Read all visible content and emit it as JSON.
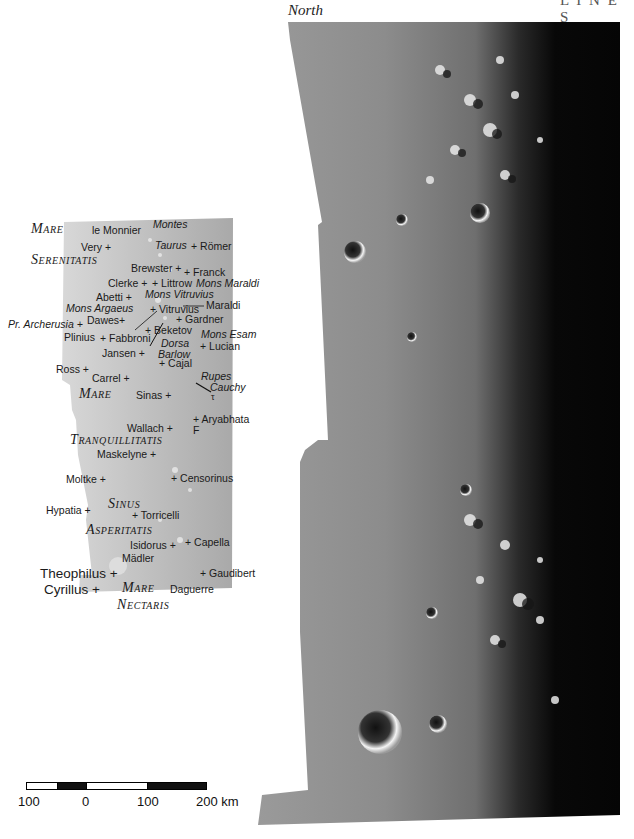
{
  "header": {
    "north_label": "North",
    "cutoff_text": "L I N E S"
  },
  "colors": {
    "background": "#ffffff",
    "keymap_fill": "#b3b3b3",
    "photo_dark": "#050505",
    "photo_mid": "#8a8a8a",
    "photo_light": "#c9c9c9"
  },
  "keymap": {
    "seas": [
      {
        "id": "mare-serenitatis-1",
        "cap": "M",
        "rest": "ARE"
      },
      {
        "id": "mare-serenitatis-2",
        "cap": "S",
        "rest": "ERENITATIS"
      },
      {
        "id": "mare-tranq-1",
        "cap": "M",
        "rest": "ARE"
      },
      {
        "id": "mare-tranq-2",
        "cap": "T",
        "rest": "RANQUILLITATIS"
      },
      {
        "id": "sinus-1",
        "cap": "S",
        "rest": "INUS"
      },
      {
        "id": "sinus-2",
        "cap": "A",
        "rest": "SPERITATIS"
      },
      {
        "id": "mare-nectaris-1",
        "cap": "M",
        "rest": "ARE"
      },
      {
        "id": "mare-nectaris-2",
        "cap": "N",
        "rest": "ECTARIS"
      }
    ],
    "features": [
      {
        "name": "le Monnier"
      },
      {
        "name": "Montes"
      },
      {
        "name": "Very +"
      },
      {
        "name": "Taurus"
      },
      {
        "name": "+ Römer"
      },
      {
        "name": "Brewster +"
      },
      {
        "name": "+ Franck"
      },
      {
        "name": "Clerke +"
      },
      {
        "name": "+ Littrow"
      },
      {
        "name": "Mons Maraldi"
      },
      {
        "name": "Abetti +"
      },
      {
        "name": "Mons Vitruvius"
      },
      {
        "name": "Mons Argaeus"
      },
      {
        "name": "+ Vitruvius"
      },
      {
        "name": "Maraldi"
      },
      {
        "name": "Pr. Archerusia +"
      },
      {
        "name": "Dawes+"
      },
      {
        "name": "+ Gardner"
      },
      {
        "name": "+ Beketov"
      },
      {
        "name": "Plinius"
      },
      {
        "name": "+ Fabbroni"
      },
      {
        "name": "Mons Esam"
      },
      {
        "name": "Dorsa"
      },
      {
        "name": "Barlow"
      },
      {
        "name": "+ Lucian"
      },
      {
        "name": "Jansen +"
      },
      {
        "name": "+ Cajal"
      },
      {
        "name": "Ross +"
      },
      {
        "name": "Carrel +"
      },
      {
        "name": "Rupes"
      },
      {
        "name": "Cauchy"
      },
      {
        "name": "τ"
      },
      {
        "name": "Sinas +"
      },
      {
        "name": "+ Aryabhata"
      },
      {
        "name": "Wallach +"
      },
      {
        "name": "F"
      },
      {
        "name": "Maskelyne +"
      },
      {
        "name": "Moltke +"
      },
      {
        "name": "+ Censorinus"
      },
      {
        "name": "Hypatia +"
      },
      {
        "name": "+ Torricelli"
      },
      {
        "name": "Isidorus +"
      },
      {
        "name": "+ Capella"
      },
      {
        "name": "Mädler"
      },
      {
        "name": "Theophilus +"
      },
      {
        "name": "+ Gaudibert"
      },
      {
        "name": "Cyrillus +"
      },
      {
        "name": "Daguerre"
      }
    ]
  },
  "scale_bar": {
    "ticks": [
      "100",
      "0",
      "100",
      "200 km"
    ],
    "unit": "km"
  }
}
